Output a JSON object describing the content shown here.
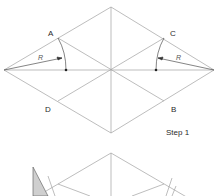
{
  "diagram": {
    "step1": {
      "label": "Step 1",
      "points": {
        "A": "A",
        "B": "B",
        "C": "C",
        "D": "D"
      },
      "radius_label_left": "R",
      "radius_label_right": "R"
    },
    "colors": {
      "line": "#9a9a9a",
      "dark_line": "#333333",
      "shade": "#cfcfcf",
      "background": "#ffffff"
    }
  }
}
